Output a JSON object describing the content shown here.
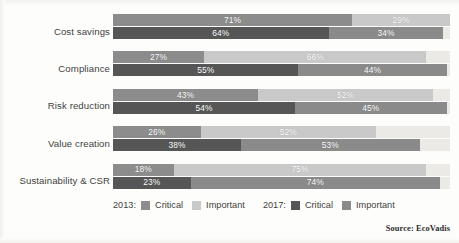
{
  "chart_data": {
    "type": "bar",
    "orientation": "horizontal",
    "stacked": true,
    "title": "",
    "subtitle": "",
    "xlabel": "",
    "ylabel": "",
    "xlim": [
      0,
      100
    ],
    "grid": false,
    "legend_position": "bottom",
    "value_suffix": "%",
    "categories": [
      "Cost savings",
      "Compliance",
      "Risk reduction",
      "Value creation",
      "Sustainability & CSR"
    ],
    "groups": [
      {
        "name": "2013",
        "label": "2013:",
        "series": [
          {
            "name": "Critical",
            "color": "#8c8c8c",
            "values": [
              71,
              27,
              43,
              26,
              18
            ]
          },
          {
            "name": "Important",
            "color": "#c9c9c9",
            "values": [
              29,
              66,
              52,
              52,
              75
            ]
          }
        ]
      },
      {
        "name": "2017",
        "label": "2017:",
        "series": [
          {
            "name": "Critical",
            "color": "#565656",
            "values": [
              64,
              55,
              54,
              38,
              23
            ]
          },
          {
            "name": "Important",
            "color": "#8a8a8a",
            "values": [
              34,
              44,
              45,
              53,
              74
            ]
          }
        ]
      }
    ],
    "data_labels": [
      {
        "category": "Cost savings",
        "group": "2013",
        "critical": "71%",
        "important": "29%"
      },
      {
        "category": "Cost savings",
        "group": "2017",
        "critical": "64%",
        "important": "34%"
      },
      {
        "category": "Compliance",
        "group": "2013",
        "critical": "27%",
        "important": "66%"
      },
      {
        "category": "Compliance",
        "group": "2017",
        "critical": "55%",
        "important": "44%"
      },
      {
        "category": "Risk reduction",
        "group": "2013",
        "critical": "43%",
        "important": "52%"
      },
      {
        "category": "Risk reduction",
        "group": "2017",
        "critical": "54%",
        "important": "45%"
      },
      {
        "category": "Value creation",
        "group": "2013",
        "critical": "26%",
        "important": "52%"
      },
      {
        "category": "Value creation",
        "group": "2017",
        "critical": "38%",
        "important": "53%"
      },
      {
        "category": "Sustainability & CSR",
        "group": "2013",
        "critical": "18%",
        "important": "75%"
      },
      {
        "category": "Sustainability & CSR",
        "group": "2017",
        "critical": "23%",
        "important": "74%"
      }
    ],
    "track_color": "#eceae6"
  },
  "legend": {
    "year_2013_label": "2013:",
    "year_2017_label": "2017:",
    "critical_label": "Critical",
    "important_label": "Important"
  },
  "footer": {
    "source": "Source: EcoVadis"
  }
}
